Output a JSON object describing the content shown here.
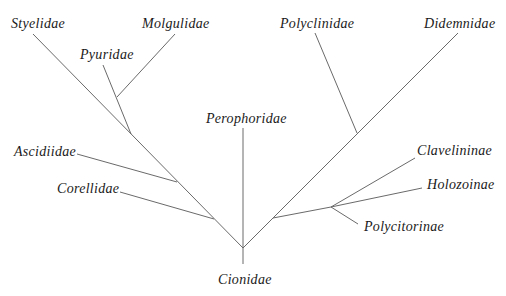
{
  "figure": {
    "type": "phylogenetic-tree",
    "header_cutoff_text": "",
    "root": "Cionidae",
    "labels": {
      "styelidae": "Styelidae",
      "molgulidae": "Molgulidae",
      "pyuridae": "Pyuridae",
      "ascidiidae": "Ascidiidae",
      "corellidae": "Corellidae",
      "perophoridae": "Perophoridae",
      "cionidae": "Cionidae",
      "polyclinidae": "Polyclinidae",
      "didemnidae": "Didemnidae",
      "clavelininae": "Clavelininae",
      "holozoinae": "Holozoinae",
      "polycitorinae": "Polycitorinae"
    },
    "taxa": [
      "Styelidae",
      "Molgulidae",
      "Pyuridae",
      "Ascidiidae",
      "Corellidae",
      "Perophoridae",
      "Cionidae",
      "Polyclinidae",
      "Didemnidae",
      "Clavelininae",
      "Holozoinae",
      "Polycitorinae"
    ],
    "structure": "(Cionidae, ((((Styelidae,(Pyuridae,Molgulidae)),Ascidiidae),Corellidae), Perophoridae, ((Clavelininae,Holozoinae,Polycitorinae),(Polyclinidae,Didemnidae))))",
    "line_color": "#6a6a6a"
  }
}
